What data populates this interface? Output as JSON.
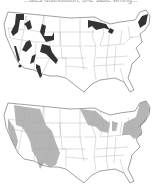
{
  "caption": "...ates distribution, one state wrong...",
  "maps": [
    {
      "id": "top",
      "description": "United States map with dark range polygons",
      "fill_color": "#333333",
      "regions": [
        "Cascades/NE Washington",
        "Northern Idaho",
        "Central Idaho",
        "Western Montana",
        "NW Wyoming",
        "Sierra Nevada",
        "Southern California dot",
        "Great Basin (Nevada)",
        "Utah/Wasatch",
        "Colorado Rockies",
        "Arizona",
        "Northern Minnesota",
        "Upper Michigan",
        "Northern Maine/New Hampshire"
      ]
    },
    {
      "id": "bottom",
      "description": "United States map with shaded states",
      "fill_color": "#b5b5b5",
      "shaded_states": [
        "Washington (parts)",
        "Oregon (parts)",
        "Idaho",
        "Montana (west)",
        "Wyoming",
        "Utah",
        "Colorado",
        "California (parts)",
        "Minnesota",
        "Wisconsin",
        "Michigan",
        "New York",
        "Pennsylvania",
        "Vermont",
        "New Hampshire",
        "Maine",
        "Massachusetts",
        "Connecticut",
        "New Jersey"
      ]
    }
  ]
}
